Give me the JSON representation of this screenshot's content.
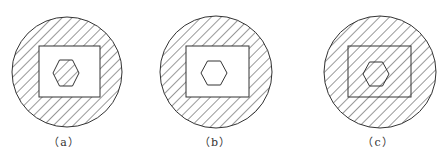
{
  "figure": {
    "stroke_color": "#333333",
    "background": "#ffffff",
    "panels": [
      {
        "id": "a",
        "label": "（a）",
        "circle": {
          "cx": 67,
          "cy": 72,
          "r": 55,
          "hatched": true
        },
        "rect": {
          "x": 39,
          "y": 46,
          "w": 61,
          "h": 51,
          "hatched": false
        },
        "hexagon": {
          "cx": 66,
          "cy": 73,
          "w": 26,
          "h": 26,
          "hatched": true
        },
        "label_pos": {
          "x": 64,
          "y": 133
        }
      },
      {
        "id": "b",
        "label": "（b）",
        "circle": {
          "cx": 216,
          "cy": 72,
          "r": 56,
          "hatched": true
        },
        "rect": {
          "x": 186,
          "y": 46,
          "w": 63,
          "h": 51,
          "hatched": false
        },
        "hexagon": {
          "cx": 214,
          "cy": 73,
          "w": 27,
          "h": 24,
          "hatched": false
        },
        "label_pos": {
          "x": 215,
          "y": 133
        }
      },
      {
        "id": "c",
        "label": "（c）",
        "circle": {
          "cx": 380,
          "cy": 72,
          "r": 56,
          "hatched": true
        },
        "rect": {
          "x": 348,
          "y": 46,
          "w": 63,
          "h": 51,
          "hatched": true
        },
        "hexagon": {
          "cx": 376,
          "cy": 74,
          "w": 27,
          "h": 24,
          "hatched": true
        },
        "label_pos": {
          "x": 378,
          "y": 133
        }
      }
    ]
  }
}
